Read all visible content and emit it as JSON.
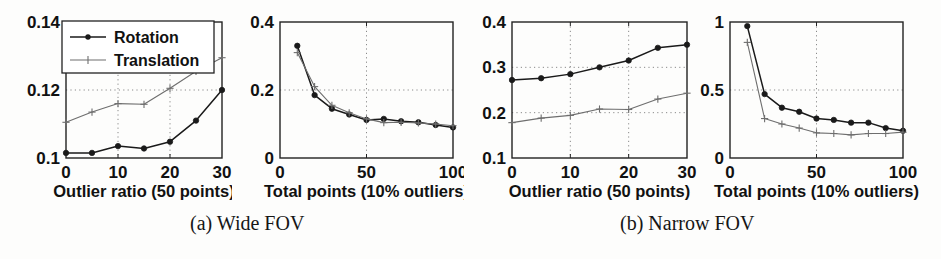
{
  "figure": {
    "captions": [
      {
        "id": "a",
        "text": "(a) Wide FOV"
      },
      {
        "id": "b",
        "text": "(b) Narrow FOV"
      }
    ]
  },
  "legend": {
    "position": "top-left-inside",
    "entries": [
      {
        "name": "Rotation",
        "marker": "filled-circle",
        "color": "#1a1a1a"
      },
      {
        "name": "Translation",
        "marker": "plus",
        "color": "#6e6e6e"
      }
    ]
  },
  "colors": {
    "rotation": "#1a1a1a",
    "translation": "#6e6e6e",
    "grid": "#8a8a8a",
    "frame": "#222222",
    "background": "#fdfdfc"
  },
  "chart_data": [
    {
      "id": "panel-1",
      "type": "line",
      "title": "",
      "group": "(a) Wide FOV",
      "xlabel": "Outlier ratio (50 points)",
      "ylabel": "",
      "xlim": [
        0,
        30
      ],
      "ylim": [
        0.1,
        0.14
      ],
      "xticks": [
        0,
        10,
        20,
        30
      ],
      "xticklabels": [
        "0",
        "10",
        "20",
        "30"
      ],
      "yticks": [
        0.1,
        0.12,
        0.14
      ],
      "yticklabels": [
        "0.1",
        "0.12",
        "0.14"
      ],
      "grid": true,
      "legend": [
        "Rotation",
        "Translation"
      ],
      "x": [
        0,
        5,
        10,
        15,
        20,
        25,
        30
      ],
      "series": [
        {
          "name": "Rotation",
          "values": [
            0.1015,
            0.1015,
            0.1035,
            0.1028,
            0.1048,
            0.111,
            0.12
          ]
        },
        {
          "name": "Translation",
          "values": [
            0.1105,
            0.1135,
            0.116,
            0.1158,
            0.1205,
            0.1255,
            0.1295
          ]
        }
      ]
    },
    {
      "id": "panel-2",
      "type": "line",
      "title": "",
      "group": "(a) Wide FOV",
      "xlabel": "Total points (10% outliers)",
      "ylabel": "",
      "xlim": [
        0,
        100
      ],
      "ylim": [
        0,
        0.4
      ],
      "xticks": [
        0,
        50,
        100
      ],
      "xticklabels": [
        "0",
        "50",
        "100"
      ],
      "yticks": [
        0,
        0.2,
        0.4
      ],
      "yticklabels": [
        "0",
        "0.2",
        "0.4"
      ],
      "grid": true,
      "legend": [
        "Rotation",
        "Translation"
      ],
      "x": [
        10,
        20,
        30,
        40,
        50,
        60,
        70,
        80,
        90,
        100
      ],
      "series": [
        {
          "name": "Rotation",
          "values": [
            0.33,
            0.185,
            0.145,
            0.128,
            0.112,
            0.115,
            0.108,
            0.105,
            0.097,
            0.09
          ]
        },
        {
          "name": "Translation",
          "values": [
            0.31,
            0.21,
            0.155,
            0.133,
            0.115,
            0.104,
            0.105,
            0.103,
            0.1,
            0.095
          ]
        }
      ]
    },
    {
      "id": "panel-3",
      "type": "line",
      "title": "",
      "group": "(b) Narrow FOV",
      "xlabel": "Outlier ratio (50 points)",
      "ylabel": "",
      "xlim": [
        0,
        30
      ],
      "ylim": [
        0.1,
        0.4
      ],
      "xticks": [
        0,
        10,
        20,
        30
      ],
      "xticklabels": [
        "0",
        "10",
        "20",
        "30"
      ],
      "yticks": [
        0.1,
        0.2,
        0.3,
        0.4
      ],
      "yticklabels": [
        "0.1",
        "0.2",
        "0.3",
        "0.4"
      ],
      "grid": true,
      "legend": [
        "Rotation",
        "Translation"
      ],
      "x": [
        0,
        5,
        10,
        15,
        20,
        25,
        30
      ],
      "series": [
        {
          "name": "Rotation",
          "values": [
            0.272,
            0.276,
            0.285,
            0.3,
            0.315,
            0.343,
            0.35
          ]
        },
        {
          "name": "Translation",
          "values": [
            0.178,
            0.188,
            0.194,
            0.208,
            0.207,
            0.23,
            0.243
          ]
        }
      ]
    },
    {
      "id": "panel-4",
      "type": "line",
      "title": "",
      "group": "(b) Narrow FOV",
      "xlabel": "Total points (10% outliers)",
      "ylabel": "",
      "xlim": [
        0,
        100
      ],
      "ylim": [
        0,
        1
      ],
      "xticks": [
        0,
        50,
        100
      ],
      "xticklabels": [
        "0",
        "50",
        "100"
      ],
      "yticks": [
        0,
        0.5,
        1
      ],
      "yticklabels": [
        "0",
        "0.5",
        "1"
      ],
      "grid": true,
      "legend": [
        "Rotation",
        "Translation"
      ],
      "x": [
        10,
        20,
        30,
        40,
        50,
        60,
        70,
        80,
        90,
        100
      ],
      "series": [
        {
          "name": "Rotation",
          "values": [
            0.97,
            0.47,
            0.37,
            0.34,
            0.29,
            0.28,
            0.26,
            0.26,
            0.22,
            0.2
          ]
        },
        {
          "name": "Translation",
          "values": [
            0.85,
            0.29,
            0.25,
            0.22,
            0.185,
            0.18,
            0.17,
            0.18,
            0.18,
            0.19
          ]
        }
      ]
    }
  ]
}
